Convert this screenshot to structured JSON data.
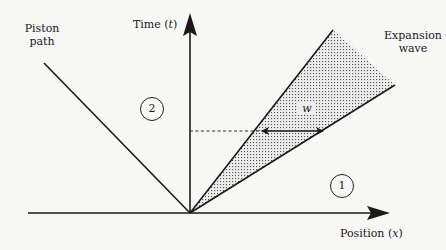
{
  "diagram": {
    "type": "x-t wave diagram",
    "axes": {
      "y_label": "Time",
      "y_var": "t",
      "x_label": "Position",
      "x_var": "x"
    },
    "labels": {
      "piston_line1": "Piston",
      "piston_line2": "path",
      "wave_line1": "Expansion",
      "wave_line2": "wave",
      "width_symbol": "w"
    },
    "regions": [
      {
        "id": "region-2",
        "label": "2"
      },
      {
        "id": "region-1",
        "label": "1"
      }
    ],
    "colors": {
      "line": "#1a1a1a",
      "background": "#f7f7f5",
      "stipple": "#555555"
    }
  }
}
